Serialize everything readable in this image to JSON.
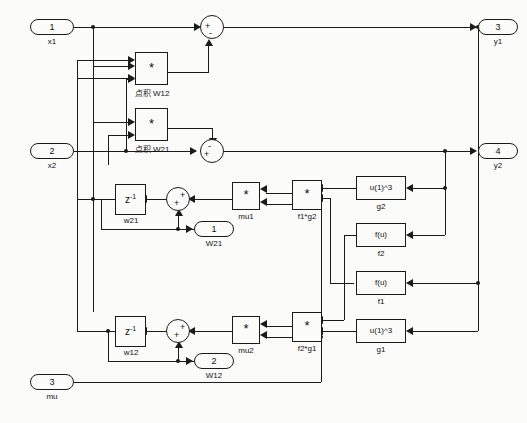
{
  "diagram": {
    "type": "block-diagram",
    "line_color": "#1b1b1b",
    "background": "#fbfbfa"
  },
  "input_ports": [
    {
      "number": "1",
      "label": "x1"
    },
    {
      "number": "2",
      "label": "x2"
    },
    {
      "number": "3",
      "label": "mu"
    }
  ],
  "output_ports": [
    {
      "number": "3",
      "label": "y1"
    },
    {
      "number": "4",
      "label": "y2"
    },
    {
      "number": "1",
      "label": "W21"
    },
    {
      "number": "2",
      "label": "W12"
    }
  ],
  "dot_product_blocks": [
    {
      "symbol": "*",
      "label": "点积 W12"
    },
    {
      "symbol": "*",
      "label": "点积 W21"
    }
  ],
  "product_blocks": [
    {
      "symbol": "*",
      "label": "mu1"
    },
    {
      "symbol": "*",
      "label": "f1*g2"
    },
    {
      "symbol": "*",
      "label": "mu2"
    },
    {
      "symbol": "*",
      "label": "f2*g1"
    }
  ],
  "delay_blocks": [
    {
      "expr": "z",
      "exponent": "-1",
      "label": "w21"
    },
    {
      "expr": "z",
      "exponent": "-1",
      "label": "w12"
    }
  ],
  "function_blocks": [
    {
      "expr": "u(1)^3",
      "label": "g2"
    },
    {
      "expr": "f(u)",
      "label": "f2"
    },
    {
      "expr": "f(u)",
      "label": "f1"
    },
    {
      "expr": "u(1)^3",
      "label": "g1"
    }
  ],
  "sum_blocks": [
    {
      "name": "sum-y1",
      "signs": [
        "+",
        "-"
      ]
    },
    {
      "name": "sum-y2",
      "signs": [
        "-",
        "+"
      ]
    },
    {
      "name": "sum-w21",
      "signs": [
        "+",
        "+"
      ]
    },
    {
      "name": "sum-w12",
      "signs": [
        "+",
        "+"
      ]
    }
  ]
}
